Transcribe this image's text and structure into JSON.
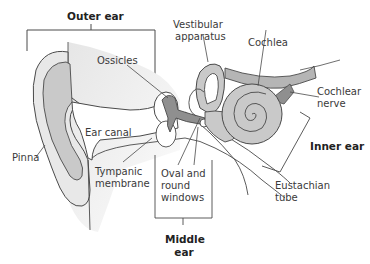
{
  "diagram": {
    "sections": {
      "outer_ear": "Outer ear",
      "middle_ear_line1": "Middle",
      "middle_ear_line2": "ear",
      "inner_ear": "Inner ear"
    },
    "labels": {
      "vestibular_line1": "Vestibular",
      "vestibular_line2": "apparatus",
      "cochlea": "Cochlea",
      "ossicles": "Ossicles",
      "cochlear_nerve_line1": "Cochlear",
      "cochlear_nerve_line2": "nerve",
      "ear_canal": "Ear canal",
      "pinna": "Pinna",
      "tympanic_line1": "Tympanic",
      "tympanic_line2": "membrane",
      "oval_line1": "Oval and",
      "oval_line2": "round",
      "oval_line3": "windows",
      "eustachian_line1": "Eustachian",
      "eustachian_line2": "tube"
    },
    "colors": {
      "line": "#4a4a4a",
      "tissue_light": "#e9e9e9",
      "tissue_mid": "#c8c8c8",
      "tissue_dark": "#8f8f8f",
      "background": "#ffffff"
    }
  }
}
